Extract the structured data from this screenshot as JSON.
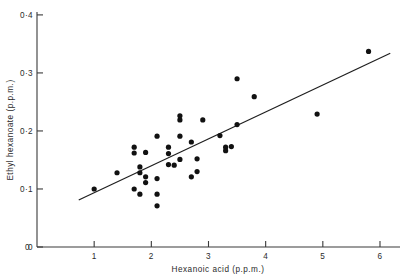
{
  "chart_data": {
    "type": "scatter",
    "title": "",
    "xlabel": "Hexanoic acid (p.p.m.)",
    "ylabel": "Ethyl hexanoate (p.p.m.)",
    "xlim": [
      0,
      6.35
    ],
    "ylim": [
      0,
      0.405
    ],
    "xticks": [
      1,
      2,
      3,
      4,
      5,
      6
    ],
    "xticklabels": [
      "1",
      "2",
      "3",
      "4",
      "5",
      "6"
    ],
    "yticks": [
      0,
      0.1,
      0.2,
      0.3,
      0.4
    ],
    "yticklabels": [
      "0",
      "0·1",
      "0·2",
      "0·3",
      "0·4"
    ],
    "grid": false,
    "legend": null,
    "x_origin_label": "0",
    "series": [
      {
        "name": "samples",
        "marker": "filled-circle",
        "color": "#111111",
        "points": [
          [
            1.0,
            0.1
          ],
          [
            1.4,
            0.128
          ],
          [
            1.7,
            0.172
          ],
          [
            1.7,
            0.162
          ],
          [
            1.7,
            0.1
          ],
          [
            1.8,
            0.138
          ],
          [
            1.8,
            0.128
          ],
          [
            1.8,
            0.091
          ],
          [
            1.9,
            0.163
          ],
          [
            1.9,
            0.121
          ],
          [
            1.9,
            0.111
          ],
          [
            2.1,
            0.191
          ],
          [
            2.1,
            0.118
          ],
          [
            2.1,
            0.091
          ],
          [
            2.1,
            0.071
          ],
          [
            2.3,
            0.172
          ],
          [
            2.3,
            0.161
          ],
          [
            2.3,
            0.142
          ],
          [
            2.4,
            0.141
          ],
          [
            2.5,
            0.226
          ],
          [
            2.5,
            0.219
          ],
          [
            2.5,
            0.191
          ],
          [
            2.5,
            0.151
          ],
          [
            2.7,
            0.181
          ],
          [
            2.7,
            0.121
          ],
          [
            2.8,
            0.152
          ],
          [
            2.8,
            0.13
          ],
          [
            2.9,
            0.219
          ],
          [
            3.2,
            0.192
          ],
          [
            3.3,
            0.172
          ],
          [
            3.3,
            0.166
          ],
          [
            3.4,
            0.173
          ],
          [
            3.5,
            0.29
          ],
          [
            3.5,
            0.211
          ],
          [
            3.8,
            0.259
          ],
          [
            4.9,
            0.229
          ],
          [
            5.8,
            0.337
          ]
        ]
      }
    ],
    "fit_line": {
      "name": "regression-line",
      "color": "#1e1e1e",
      "x_start": 0.73,
      "y_start": 0.081,
      "x_end": 6.18,
      "y_end": 0.334
    }
  }
}
